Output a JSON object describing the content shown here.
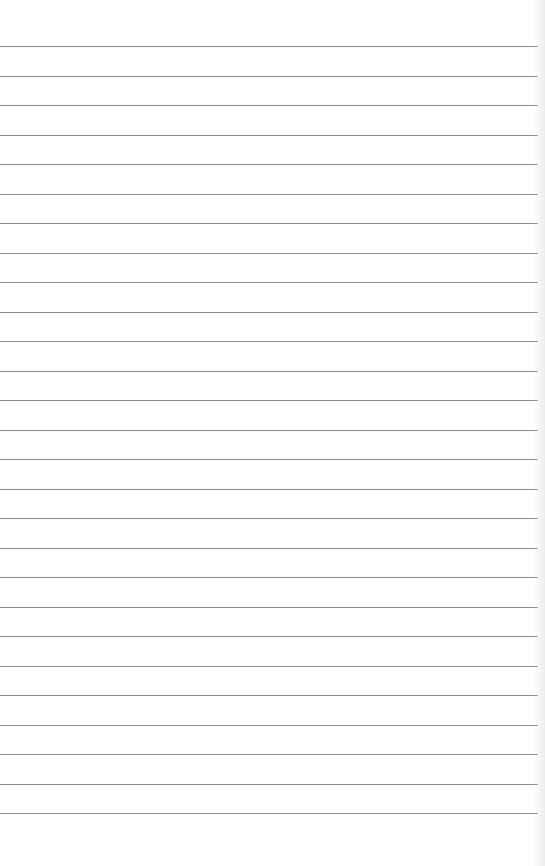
{
  "document": {
    "type": "lined-notepad-page",
    "text_content": "",
    "rule_count": 27,
    "first_rule_y": 46,
    "rule_spacing": 29.5,
    "rule_color": "#8a8a8a",
    "paper_color": "#ffffff"
  }
}
